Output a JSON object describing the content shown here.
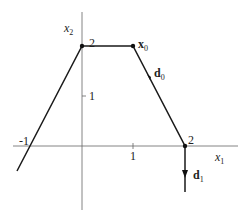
{
  "figure": {
    "axes": {
      "x_label": "x",
      "x_label_sub": "1",
      "y_label": "x",
      "y_label_sub": "2",
      "x_ticks": [
        "-1",
        "1",
        "2"
      ],
      "y_ticks": [
        "1",
        "2"
      ]
    },
    "vectors": {
      "x0": {
        "name": "x",
        "sub": "0"
      },
      "d0": {
        "name": "d",
        "sub": "0"
      },
      "d1": {
        "name": "d",
        "sub": "1"
      }
    },
    "polygon_vertices": [
      [
        -1.2,
        -0.5
      ],
      [
        0,
        2
      ],
      [
        1,
        2
      ],
      [
        2,
        0
      ],
      [
        2,
        -1
      ]
    ],
    "colors": {
      "line": "#1a1a1a",
      "axis": "#555555"
    }
  }
}
